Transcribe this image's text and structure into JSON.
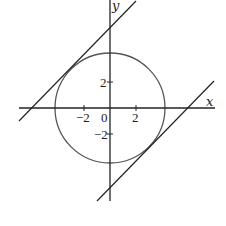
{
  "diagram": {
    "type": "coordinate-plot",
    "axes": {
      "x_label": "x",
      "y_label": "y",
      "origin_label": "0",
      "x_ticks": [
        {
          "value": -2,
          "label": "−2"
        },
        {
          "value": 2,
          "label": "2"
        }
      ],
      "y_ticks": [
        {
          "value": 2,
          "label": "2"
        },
        {
          "value": -2,
          "label": "−2"
        }
      ]
    },
    "circle": {
      "center": [
        0,
        0
      ],
      "radius": 4.24,
      "equation": "x^2 + y^2 = 18",
      "color": "#555555"
    },
    "lines": [
      {
        "name": "upper-tangent",
        "slope": 1,
        "intercept": 6,
        "equation": "y = x + 6",
        "color": "#222222"
      },
      {
        "name": "lower-tangent",
        "slope": 1,
        "intercept": -6,
        "equation": "y = x - 6",
        "color": "#222222"
      }
    ],
    "colors": {
      "axis": "#222222",
      "circle": "#555555",
      "background": "#ffffff"
    }
  }
}
